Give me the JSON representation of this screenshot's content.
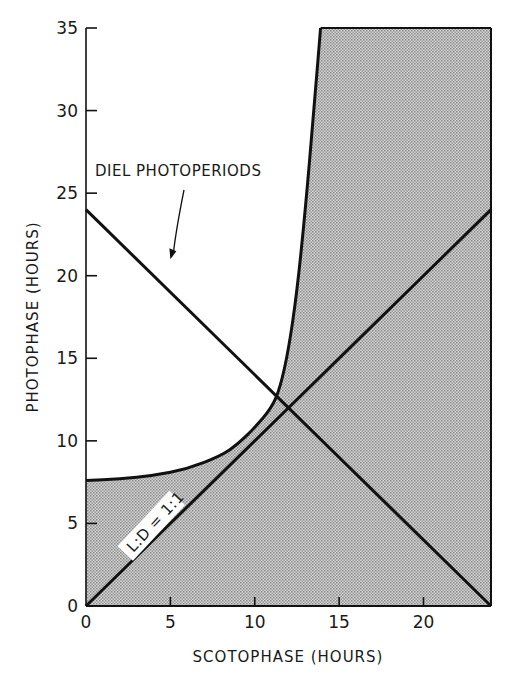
{
  "chart_data": {
    "type": "line",
    "title": "",
    "xlabel": "SCOTOPHASE (HOURS)",
    "ylabel": "PHOTOPHASE (HOURS)",
    "xlim": [
      0,
      24
    ],
    "ylim": [
      0,
      35
    ],
    "x_ticks": [
      0,
      5,
      10,
      15,
      20
    ],
    "y_ticks": [
      0,
      5,
      10,
      15,
      20,
      25,
      30,
      35
    ],
    "x_tick_labels": [
      "0",
      "5",
      "10",
      "15",
      "20"
    ],
    "y_tick_labels": [
      "0",
      "5",
      "10",
      "15",
      "20",
      "25",
      "30",
      "35"
    ],
    "grid": false,
    "legend": null,
    "series": [
      {
        "name": "DIEL PHOTOPERIODS",
        "description": "Photophase + Scotophase = 24 h",
        "x": [
          0,
          24
        ],
        "y": [
          24,
          0
        ]
      },
      {
        "name": "L:D = 1:1",
        "description": "Photophase = Scotophase",
        "x": [
          0,
          24
        ],
        "y": [
          0,
          24
        ]
      },
      {
        "name": "Boundary curve",
        "description": "Upper/left boundary of shaded region",
        "x": [
          0,
          2,
          4,
          6,
          8,
          9,
          10,
          11,
          11.5,
          12,
          12.5,
          13,
          13.5,
          13.9
        ],
        "y": [
          7.6,
          7.7,
          7.9,
          8.3,
          9.1,
          9.8,
          10.8,
          12.0,
          13.2,
          15.5,
          19.0,
          24.0,
          30.0,
          35.0
        ]
      }
    ],
    "shaded_region": {
      "description": "Stippled gray area bounded by the x-axis, y-axis (0 to 7.6), the boundary curve, top at 35, and right edge at x=24",
      "fill": "#b8b8b8"
    },
    "annotations": [
      {
        "text": "DIEL PHOTOPERIODS",
        "x": 0.5,
        "y": 26.5,
        "arrow_to": [
          5.0,
          21.0
        ]
      },
      {
        "text": "L:D = 1:1",
        "x": 3,
        "y": 3.5,
        "rotation": 45
      }
    ],
    "intersections": [
      {
        "label": "curve x diel",
        "x": 11.3,
        "y": 12.6
      },
      {
        "label": "L:D x diel",
        "x": 12,
        "y": 12
      }
    ]
  },
  "colors": {
    "line": "#111111",
    "shade": "#b8b8b8",
    "background": "#ffffff"
  }
}
